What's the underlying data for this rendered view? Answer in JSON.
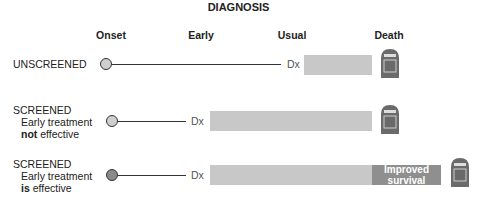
{
  "title": "DIAGNOSIS",
  "columns": [
    "Onset",
    "Early",
    "Usual",
    "Death"
  ],
  "rows": [
    {
      "label_line1": "UNSCREENED",
      "label_line2": "",
      "label_bold": "",
      "label_rest": "",
      "dx": "Dx",
      "bar_label": ""
    },
    {
      "label_line1": "SCREENED",
      "label_line2": "Early treatment",
      "label_bold": "not",
      "label_rest": " effective",
      "dx": "Dx",
      "bar_label": ""
    },
    {
      "label_line1": "SCREENED",
      "label_line2": "Early treatment",
      "label_bold": "is",
      "label_rest": " effective",
      "dx": "Dx",
      "bar_label_1": "Improved",
      "bar_label_2": "survival"
    }
  ],
  "tombstone_text": "R.I.P.",
  "colors": {
    "bar": "#c8c8c8",
    "improved_bar": "#8f8f8f",
    "circle_light": "#cfcfcf",
    "circle_dark": "#8a8a8a",
    "tombstone": "#6a6a6a"
  }
}
